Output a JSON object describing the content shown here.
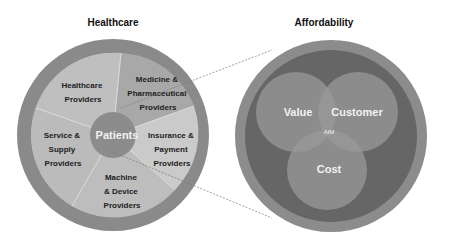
{
  "left": {
    "title": "Healthcare",
    "center_label": "Patients",
    "segments": [
      {
        "lines": [
          "Healthcare",
          "Providers"
        ]
      },
      {
        "lines": [
          "Medicine &",
          "Pharmaceutical",
          "Providers"
        ]
      },
      {
        "lines": [
          "Insurance &",
          "Payment",
          "Providers"
        ]
      },
      {
        "lines": [
          "Machine",
          "& Device",
          "Providers"
        ]
      },
      {
        "lines": [
          "Service &",
          "Supply",
          "Providers"
        ]
      }
    ]
  },
  "right": {
    "title": "Affordability",
    "venn": {
      "value": "Value",
      "customer": "Customer",
      "cost": "Cost",
      "center": "AIM"
    }
  },
  "colors": {
    "outer_ring": "#8a8a8a",
    "segment_light": "#c4c4c4",
    "segment_dark": "#a9a9a9",
    "patients": "#8c8c8c",
    "right_inner": "#666666",
    "venn_circle": "#8f8f8f"
  }
}
